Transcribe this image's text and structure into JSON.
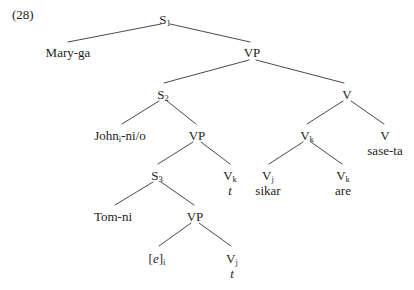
{
  "figure": {
    "example_number": "(28)"
  },
  "tree": {
    "nodes": [
      {
        "id": "s1",
        "label": "S",
        "sub": "1",
        "lex": "",
        "lex_italic": false,
        "x": 165,
        "y": 13
      },
      {
        "id": "mary",
        "label": "Mary-ga",
        "sub": "",
        "lex": "",
        "lex_italic": false,
        "x": 68,
        "y": 46
      },
      {
        "id": "vp1",
        "label": "VP",
        "sub": "",
        "lex": "",
        "lex_italic": false,
        "x": 252,
        "y": 46
      },
      {
        "id": "s2",
        "label": "S",
        "sub": "2",
        "lex": "",
        "lex_italic": false,
        "x": 163,
        "y": 88
      },
      {
        "id": "v-top",
        "label": "V",
        "sub": "",
        "lex": "",
        "lex_italic": false,
        "x": 347,
        "y": 88
      },
      {
        "id": "john",
        "label": "John",
        "sub": "i",
        "lex": "",
        "lex_italic": false,
        "x": 120,
        "y": 129,
        "suffix": "-ni/o"
      },
      {
        "id": "vp2",
        "label": "VP",
        "sub": "",
        "lex": "",
        "lex_italic": false,
        "x": 197,
        "y": 129
      },
      {
        "id": "vk-mid",
        "label": "V",
        "sub": "k",
        "lex": "",
        "lex_italic": false,
        "x": 307,
        "y": 129
      },
      {
        "id": "v-sase",
        "label": "V",
        "sub": "",
        "lex": "sase-ta",
        "lex_italic": false,
        "x": 385,
        "y": 129
      },
      {
        "id": "s3",
        "label": "S",
        "sub": "3",
        "lex": "",
        "lex_italic": false,
        "x": 157,
        "y": 169
      },
      {
        "id": "vk-trace",
        "label": "V",
        "sub": "k",
        "lex": "t",
        "lex_italic": true,
        "x": 230,
        "y": 169
      },
      {
        "id": "vj-sikar",
        "label": "V",
        "sub": "j",
        "lex": "sikar",
        "lex_italic": false,
        "x": 268,
        "y": 169
      },
      {
        "id": "vk-are",
        "label": "V",
        "sub": "k",
        "lex": "are",
        "lex_italic": false,
        "x": 343,
        "y": 169
      },
      {
        "id": "tom",
        "label": "Tom-ni",
        "sub": "",
        "lex": "",
        "lex_italic": false,
        "x": 113,
        "y": 210
      },
      {
        "id": "vp3",
        "label": "VP",
        "sub": "",
        "lex": "",
        "lex_italic": false,
        "x": 195,
        "y": 210
      },
      {
        "id": "empty-e",
        "label": "[e]",
        "sub": "i",
        "lex": "",
        "lex_italic": false,
        "x": 157,
        "y": 252,
        "bracket_italic": true
      },
      {
        "id": "vj-trace",
        "label": "V",
        "sub": "j",
        "lex": "t",
        "lex_italic": true,
        "x": 232,
        "y": 252
      }
    ],
    "edges": [
      {
        "from": "s1",
        "to": "mary",
        "x1": 161,
        "y1": 24,
        "x2": 68,
        "y2": 42
      },
      {
        "from": "s1",
        "to": "vp1",
        "x1": 170,
        "y1": 24,
        "x2": 250,
        "y2": 42
      },
      {
        "from": "vp1",
        "to": "s2",
        "x1": 249,
        "y1": 60,
        "x2": 164,
        "y2": 83
      },
      {
        "from": "vp1",
        "to": "v-top",
        "x1": 256,
        "y1": 60,
        "x2": 344,
        "y2": 83
      },
      {
        "from": "s2",
        "to": "john",
        "x1": 159,
        "y1": 101,
        "x2": 122,
        "y2": 124
      },
      {
        "from": "s2",
        "to": "vp2",
        "x1": 167,
        "y1": 101,
        "x2": 196,
        "y2": 124
      },
      {
        "from": "v-top",
        "to": "vk-mid",
        "x1": 343,
        "y1": 101,
        "x2": 307,
        "y2": 124
      },
      {
        "from": "v-top",
        "to": "v-sase",
        "x1": 351,
        "y1": 101,
        "x2": 384,
        "y2": 124
      },
      {
        "from": "vp2",
        "to": "s3",
        "x1": 193,
        "y1": 142,
        "x2": 158,
        "y2": 164
      },
      {
        "from": "vp2",
        "to": "vk-trace",
        "x1": 201,
        "y1": 142,
        "x2": 230,
        "y2": 164
      },
      {
        "from": "vk-mid",
        "to": "vj-sikar",
        "x1": 303,
        "y1": 142,
        "x2": 269,
        "y2": 164
      },
      {
        "from": "vk-mid",
        "to": "vk-are",
        "x1": 311,
        "y1": 142,
        "x2": 342,
        "y2": 164
      },
      {
        "from": "s3",
        "to": "tom",
        "x1": 153,
        "y1": 182,
        "x2": 115,
        "y2": 205
      },
      {
        "from": "s3",
        "to": "vp3",
        "x1": 161,
        "y1": 182,
        "x2": 194,
        "y2": 205
      },
      {
        "from": "vp3",
        "to": "empty-e",
        "x1": 191,
        "y1": 223,
        "x2": 159,
        "y2": 246
      },
      {
        "from": "vp3",
        "to": "vj-trace",
        "x1": 199,
        "y1": 223,
        "x2": 231,
        "y2": 246
      }
    ],
    "style": {
      "line_color": "#4a4a4a",
      "line_width": 1.0,
      "text_color": "#242424"
    }
  }
}
